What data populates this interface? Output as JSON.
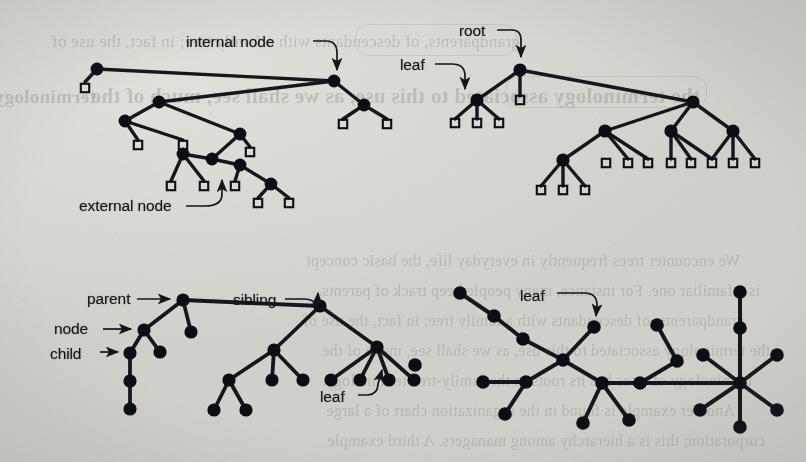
{
  "figure": {
    "kind": "tree-diagrams",
    "panel_count": 4,
    "ink_color": "#111114",
    "page_color": "#d9d7d2"
  },
  "labels": {
    "internal_node": "internal node",
    "external_node": "external node",
    "root": "root",
    "leaf_tree2": "leaf",
    "parent": "parent",
    "node": "node",
    "child": "child",
    "sibling": "sibling",
    "leaf_tree3": "leaf",
    "leaf_tree4": "leaf"
  },
  "background_text": {
    "line1": "We encounter trees frequently in everyday life, the basic concept",
    "line2": "is a familiar one. For instance, many people keep track of parents,",
    "line3": "grandparents, of descendants with a family tree; in fact, the use of",
    "line4": "the terminology associated to this use, as we shall see, much of the",
    "line5": "terminology of trees has its roots in the family-tree terminology.",
    "line6": "Another example is found in the organization chart of a large",
    "line7": "corporation; this is a hierarchy among managers. A third example"
  },
  "panels": [
    {
      "id": "tree1",
      "title": "binary tree with internal and external nodes",
      "internal_nodes": [
        {
          "id": "a",
          "x": 97,
          "y": 69
        },
        {
          "id": "b",
          "x": 334,
          "y": 81
        },
        {
          "id": "c",
          "x": 159,
          "y": 102
        },
        {
          "id": "d",
          "x": 364,
          "y": 105
        },
        {
          "id": "e",
          "x": 125,
          "y": 121
        },
        {
          "id": "f",
          "x": 240,
          "y": 134
        },
        {
          "id": "g",
          "x": 212,
          "y": 159
        },
        {
          "id": "h",
          "x": 183,
          "y": 154
        },
        {
          "id": "i",
          "x": 240,
          "y": 165
        },
        {
          "id": "j",
          "x": 271,
          "y": 184
        }
      ],
      "external_nodes": [
        {
          "x": 85,
          "y": 88
        },
        {
          "x": 138,
          "y": 145
        },
        {
          "x": 183,
          "y": 145
        },
        {
          "x": 343,
          "y": 124
        },
        {
          "x": 387,
          "y": 124
        },
        {
          "x": 250,
          "y": 152
        },
        {
          "x": 171,
          "y": 186
        },
        {
          "x": 204,
          "y": 186
        },
        {
          "x": 235,
          "y": 186
        },
        {
          "x": 258,
          "y": 203
        },
        {
          "x": 289,
          "y": 203
        }
      ]
    },
    {
      "id": "tree2",
      "title": "general tree with root and leaves",
      "internal_nodes": [
        {
          "id": "root",
          "x": 520,
          "y": 70
        },
        {
          "id": "leaf",
          "x": 477,
          "y": 100
        },
        {
          "id": "r2",
          "x": 693,
          "y": 102
        },
        {
          "id": "c1",
          "x": 605,
          "y": 131
        },
        {
          "id": "c2",
          "x": 671,
          "y": 131
        },
        {
          "id": "c3",
          "x": 733,
          "y": 131
        },
        {
          "id": "c0",
          "x": 563,
          "y": 160
        }
      ],
      "external_nodes": [
        {
          "x": 455,
          "y": 123
        },
        {
          "x": 477,
          "y": 123
        },
        {
          "x": 499,
          "y": 123
        },
        {
          "x": 520,
          "y": 100
        },
        {
          "x": 606,
          "y": 163
        },
        {
          "x": 628,
          "y": 163
        },
        {
          "x": 648,
          "y": 163
        },
        {
          "x": 671,
          "y": 163
        },
        {
          "x": 691,
          "y": 163
        },
        {
          "x": 712,
          "y": 163
        },
        {
          "x": 733,
          "y": 163
        },
        {
          "x": 755,
          "y": 163
        },
        {
          "x": 541,
          "y": 190
        },
        {
          "x": 563,
          "y": 190
        },
        {
          "x": 585,
          "y": 190
        }
      ]
    },
    {
      "id": "tree3",
      "title": "tree showing parent, node, child, sibling, leaf",
      "nodes": [
        {
          "id": "parent",
          "x": 183,
          "y": 300
        },
        {
          "id": "node",
          "x": 144,
          "y": 330
        },
        {
          "id": "mid",
          "x": 191,
          "y": 332
        },
        {
          "id": "child",
          "x": 130,
          "y": 353
        },
        {
          "id": "n2",
          "x": 160,
          "y": 352
        },
        {
          "id": "chain1",
          "x": 130,
          "y": 381
        },
        {
          "id": "chain2",
          "x": 130,
          "y": 409
        },
        {
          "id": "sibling",
          "x": 320,
          "y": 306
        },
        {
          "id": "s1",
          "x": 274,
          "y": 350
        },
        {
          "id": "s2",
          "x": 377,
          "y": 347
        },
        {
          "id": "s1a",
          "x": 229,
          "y": 380
        },
        {
          "id": "s1b",
          "x": 272,
          "y": 380
        },
        {
          "id": "s1c",
          "x": 303,
          "y": 380
        },
        {
          "id": "s1a1",
          "x": 214,
          "y": 410
        },
        {
          "id": "s1a2",
          "x": 246,
          "y": 410
        },
        {
          "id": "s2a",
          "x": 331,
          "y": 380
        },
        {
          "id": "s2b",
          "x": 360,
          "y": 380
        },
        {
          "id": "s2c",
          "x": 389,
          "y": 380
        },
        {
          "id": "s2d",
          "x": 414,
          "y": 380
        }
      ]
    },
    {
      "id": "tree4",
      "title": "free tree",
      "nodes": [
        {
          "id": "f1",
          "x": 460,
          "y": 293
        },
        {
          "id": "f2",
          "x": 494,
          "y": 316
        },
        {
          "id": "f3",
          "x": 523,
          "y": 339
        },
        {
          "id": "hub1",
          "x": 563,
          "y": 360
        },
        {
          "id": "lf",
          "x": 594,
          "y": 327
        },
        {
          "id": "h1a",
          "x": 526,
          "y": 382
        },
        {
          "id": "h1b",
          "x": 483,
          "y": 382
        },
        {
          "id": "h1c",
          "x": 505,
          "y": 414
        },
        {
          "id": "mid2",
          "x": 602,
          "y": 383
        },
        {
          "id": "m2a",
          "x": 583,
          "y": 423
        },
        {
          "id": "m2b",
          "x": 629,
          "y": 420
        },
        {
          "id": "r1",
          "x": 640,
          "y": 383
        },
        {
          "id": "r2",
          "x": 677,
          "y": 361
        },
        {
          "id": "r3",
          "x": 657,
          "y": 325
        },
        {
          "id": "hub2",
          "x": 740,
          "y": 383
        },
        {
          "id": "t1",
          "x": 740,
          "y": 328
        },
        {
          "id": "t0",
          "x": 740,
          "y": 292
        },
        {
          "id": "t2",
          "x": 777,
          "y": 355
        },
        {
          "id": "t3",
          "x": 777,
          "y": 410
        },
        {
          "id": "t4",
          "x": 740,
          "y": 427
        },
        {
          "id": "t5",
          "x": 700,
          "y": 410
        },
        {
          "id": "t6",
          "x": 703,
          "y": 355
        },
        {
          "id": "iso",
          "x": 415,
          "y": 365
        }
      ]
    }
  ]
}
